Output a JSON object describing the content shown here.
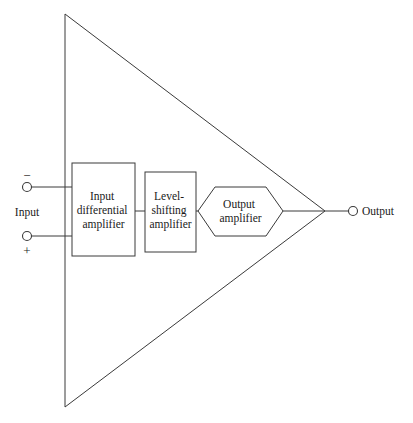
{
  "diagram": {
    "type": "block-diagram",
    "colors": {
      "background": "#ffffff",
      "line": "#3a3a3a",
      "text": "#1a1a1a"
    },
    "amplifier_symbol": {
      "name": "triangle-amplifier-outline",
      "points": "65,14 325,211 65,407"
    },
    "blocks": [
      {
        "id": "input-differential-amplifier",
        "shape": "rect",
        "lines": [
          "Input",
          "differential",
          "amplifier"
        ],
        "x": 72,
        "y": 163,
        "width": 63,
        "height": 93
      },
      {
        "id": "level-shifting-amplifier",
        "shape": "rect",
        "lines": [
          "Level-",
          "shifting",
          "amplifier"
        ],
        "x": 145,
        "y": 172,
        "width": 51,
        "height": 80
      },
      {
        "id": "output-amplifier",
        "shape": "hexagon",
        "lines": [
          "Output",
          "amplifier"
        ],
        "x": 198,
        "y": 187,
        "width": 85,
        "height": 49
      }
    ],
    "terminals": [
      {
        "id": "inverting-input-terminal",
        "sign": "−",
        "sign_x": 27,
        "sign_y": 180,
        "cx": 27,
        "cy": 187,
        "r": 4.5,
        "wire": {
          "x1": 31.5,
          "y1": 187,
          "x2": 72,
          "y2": 187
        }
      },
      {
        "id": "noninverting-input-terminal",
        "sign": "+",
        "sign_x": 27,
        "sign_y": 255,
        "cx": 27,
        "cy": 236,
        "r": 4.5,
        "wire": {
          "x1": 31.5,
          "y1": 236,
          "x2": 72,
          "y2": 236
        }
      },
      {
        "id": "output-terminal",
        "sign": "",
        "cx": 353,
        "cy": 211,
        "r": 4.5,
        "wire": {
          "x1": 325,
          "y1": 211,
          "x2": 348.5,
          "y2": 211
        }
      }
    ],
    "connectors": [
      {
        "id": "wire-diff-to-level",
        "x1": 135,
        "y1": 211,
        "x2": 145,
        "y2": 211
      },
      {
        "id": "wire-level-to-output-amp",
        "x1": 196,
        "y1": 211,
        "x2": 198,
        "y2": 211
      },
      {
        "id": "wire-output-amp-to-apex",
        "x1": 283,
        "y1": 211,
        "x2": 325,
        "y2": 211
      }
    ],
    "labels": {
      "input": "Input",
      "output": "Output",
      "input_x": 27,
      "input_y": 215,
      "output_x": 362,
      "output_y": 215
    }
  }
}
